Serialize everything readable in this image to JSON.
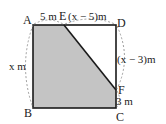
{
  "diagram": {
    "type": "geometry-square-shaded",
    "colors": {
      "shade": "#c4c4c4",
      "stroke": "#1a1a1a",
      "dashed": "#888888",
      "background": "#ffffff"
    },
    "points": {
      "A": "A",
      "B": "B",
      "C": "C",
      "D": "D",
      "E": "E",
      "F": "F"
    },
    "measurements": {
      "AE": "5 m",
      "ED": "(x − 5)m",
      "DF": "(x − 3)m",
      "FC": "3 m",
      "AB": "x m"
    },
    "shaded_region": [
      "A",
      "E",
      "F",
      "C",
      "B"
    ]
  }
}
